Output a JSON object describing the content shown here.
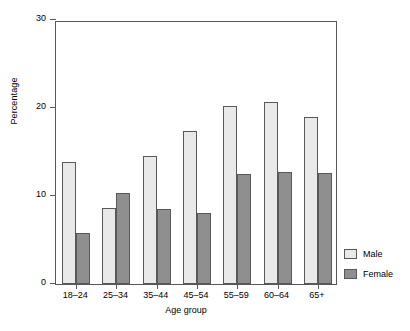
{
  "chart_data": {
    "type": "bar",
    "title": "",
    "subtitle": "",
    "xlabel": "Age group",
    "ylabel": "Percentage",
    "categories": [
      "18–24",
      "25–34",
      "35–44",
      "45–54",
      "55–59",
      "60–64",
      "65+"
    ],
    "series": [
      {
        "name": "Male",
        "color": "#e9e9e9",
        "values": [
          13.9,
          8.6,
          14.5,
          17.4,
          20.2,
          20.7,
          19.0
        ]
      },
      {
        "name": "Female",
        "color": "#8f8f8f",
        "values": [
          5.8,
          10.3,
          8.5,
          8.1,
          12.5,
          12.7,
          12.6
        ]
      }
    ],
    "ylim": [
      0,
      30
    ],
    "yticks": [
      0,
      10,
      20,
      30
    ],
    "yticklabels": [
      "0",
      "10",
      "20",
      "30"
    ],
    "grid": false,
    "legend_position": "right"
  },
  "legend": {
    "entries": [
      {
        "label": "Male",
        "swatch": "male-swatch"
      },
      {
        "label": "Female",
        "swatch": "female-swatch"
      }
    ]
  },
  "axes": {
    "y_title": "Percentage",
    "x_title": "Age group"
  }
}
